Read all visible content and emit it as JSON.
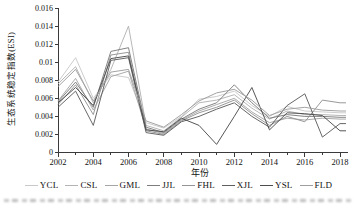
{
  "figure": {
    "xlabel": "年份",
    "ylabel": "生态系统稳定指数(ESI)"
  },
  "chart_data": {
    "type": "line",
    "x": [
      2002,
      2003,
      2004,
      2005,
      2006,
      2007,
      2008,
      2009,
      2010,
      2011,
      2012,
      2013,
      2014,
      2015,
      2016,
      2017,
      2018
    ],
    "x_ticks": [
      "2002",
      "2004",
      "2006",
      "2008",
      "2010",
      "2012",
      "2014",
      "2016",
      "2018"
    ],
    "y_ticks": [
      "0",
      "0.002",
      "0.004",
      "0.006",
      "0.008",
      "0.01",
      "0.012",
      "0.014",
      "0.016"
    ],
    "xlim": [
      2002,
      2018.4
    ],
    "ylim": [
      0,
      0.016
    ],
    "grid": false,
    "legend_position": "bottom",
    "xlabel": "年份",
    "ylabel": "生态系统稳定指数(ESI)",
    "axis_color": "#3a3a3a",
    "series": [
      {
        "name": "YCL",
        "color": "#c9c9c9",
        "values": [
          0.0078,
          0.0105,
          0.006,
          0.0086,
          0.0083,
          0.0033,
          0.0027,
          0.004,
          0.0059,
          0.0062,
          0.0068,
          0.0052,
          0.004,
          0.0051,
          0.0046,
          0.0045,
          0.0044
        ]
      },
      {
        "name": "CSL",
        "color": "#b3b3b3",
        "values": [
          0.0076,
          0.0095,
          0.0055,
          0.0092,
          0.014,
          0.003,
          0.0024,
          0.0039,
          0.0055,
          0.0058,
          0.0064,
          0.0049,
          0.0037,
          0.0046,
          0.0042,
          0.0042,
          0.0041
        ]
      },
      {
        "name": "GML",
        "color": "#a6a6a6",
        "values": [
          0.0057,
          0.0082,
          0.0047,
          0.0084,
          0.009,
          0.0026,
          0.0021,
          0.0036,
          0.0046,
          0.0053,
          0.006,
          0.0045,
          0.0033,
          0.0038,
          0.0036,
          0.0038,
          0.0037
        ]
      },
      {
        "name": "JJL",
        "color": "#7d7d7d",
        "values": [
          0.0056,
          0.0078,
          0.005,
          0.0112,
          0.0116,
          0.0028,
          0.0022,
          0.0037,
          0.0048,
          0.0055,
          0.0075,
          0.0055,
          0.0038,
          0.0042,
          0.004,
          0.004,
          0.0039
        ]
      },
      {
        "name": "FHL",
        "color": "#949494",
        "values": [
          0.0053,
          0.0075,
          0.0042,
          0.0108,
          0.0111,
          0.0024,
          0.002,
          0.0035,
          0.0044,
          0.005,
          0.0058,
          0.0043,
          0.003,
          0.004,
          0.0034,
          0.0058,
          0.0055
        ]
      },
      {
        "name": "XJL",
        "color": "#5f5f5f",
        "values": [
          0.005,
          0.0068,
          0.003,
          0.0102,
          0.0105,
          0.0022,
          0.0019,
          0.0034,
          0.004,
          0.0048,
          0.0055,
          0.004,
          0.0028,
          0.0052,
          0.0065,
          0.0017,
          0.0032
        ]
      },
      {
        "name": "YSL",
        "color": "#4d4d4d",
        "values": [
          0.0055,
          0.0072,
          0.0052,
          0.0104,
          0.0107,
          0.0025,
          0.0023,
          0.0038,
          0.003,
          0.0009,
          0.004,
          0.0072,
          0.0025,
          0.0044,
          0.0043,
          0.0041,
          0.0024
        ]
      },
      {
        "name": "FLD",
        "color": "#9e9e9e",
        "values": [
          0.0073,
          0.0092,
          0.0057,
          0.0089,
          0.0092,
          0.0035,
          0.0028,
          0.0042,
          0.0057,
          0.0066,
          0.007,
          0.0058,
          0.0041,
          0.0048,
          0.005,
          0.0047,
          0.0046
        ]
      }
    ]
  }
}
